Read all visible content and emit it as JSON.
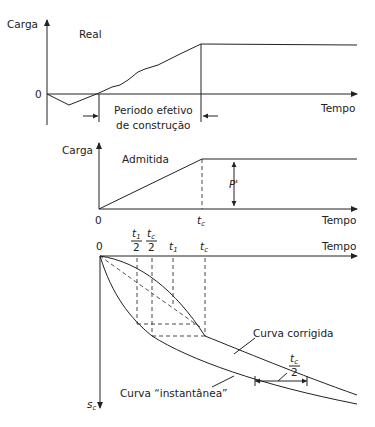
{
  "panel_real": {
    "ylabel": "Carga",
    "title": "Real",
    "origin": "0",
    "xlabel": "Tempo",
    "period_line1": "Periodo efetivo",
    "period_line2": "de construção"
  },
  "panel_admitida": {
    "ylabel": "Carga",
    "title": "Admitida",
    "origin": "0",
    "tc_label": "t",
    "tc_sub": "c",
    "load_label": "P'",
    "xlabel": "Tempo"
  },
  "panel_settlement": {
    "origin": "0",
    "xlabel": "Tempo",
    "ylabel": "s",
    "ylabel_sub": "c",
    "t1_half_num": "t",
    "t1_half_sub": "1",
    "tc_half_num": "t",
    "tc_half_sub": "c",
    "den": "2",
    "t1": "t",
    "t1_sub": "1",
    "tc": "t",
    "tc_sub": "c",
    "curve_corrected": "Curva corrigida",
    "curve_instant": "Curva “instantânea”",
    "offset_num": "t",
    "offset_sub": "c",
    "offset_den": "2"
  }
}
